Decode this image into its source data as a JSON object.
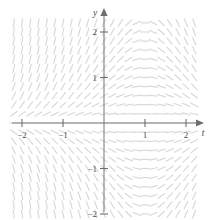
{
  "figure": {
    "kind": "slope-field",
    "background_color": "#ffffff",
    "segment_color": "#d8d8d8",
    "axis_color": "#808080",
    "label_color": "#4d4d4d"
  },
  "chart_data": {
    "type": "scatter",
    "subtype": "slope-field",
    "title": "",
    "subtitle": "",
    "xlabel": "t",
    "ylabel": "y",
    "xlim": [
      -2.35,
      2.35
    ],
    "ylim": [
      -2.35,
      2.35
    ],
    "grid": false,
    "legend": null,
    "xticks": [
      -2,
      -1,
      1,
      2
    ],
    "xtick_labels": [
      "-2",
      "-1",
      "1",
      "2"
    ],
    "yticks": [
      -2,
      -1,
      1,
      2
    ],
    "ytick_labels": [
      "-2",
      "-1",
      "1",
      "2"
    ],
    "axes": {
      "x_axis_label": "t",
      "y_axis_label": "y",
      "x_arrow": true,
      "y_arrow": true
    },
    "pixel_mapping": {
      "origin_x": 104,
      "origin_y": 123,
      "unit_px_x": 41,
      "unit_px_y": 45.5
    },
    "field": {
      "description": "Direction field of dy/dt; slope magnitude is large for t<0 at large |y| and for t>0 at negative y, flattening in the upper-right and lower-left regions.",
      "slope_formula": "dy/dt = y * (1 - t)",
      "segment_length_px": 9,
      "grid_t_start": -2.2,
      "grid_t_end": 2.2,
      "grid_t_step": 0.2,
      "grid_y_start": -2.2,
      "grid_y_end": 2.2,
      "grid_y_step": 0.2
    }
  }
}
